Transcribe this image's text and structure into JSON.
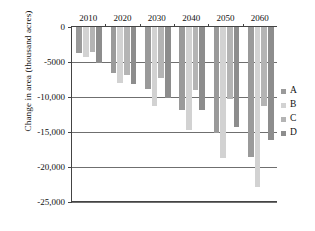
{
  "chart_data": {
    "type": "bar",
    "title": "",
    "xlabel": "",
    "ylabel": "Change in area (thousand acres)",
    "categories": [
      "2010",
      "2020",
      "2030",
      "2040",
      "2050",
      "2060"
    ],
    "ylim": [
      -25000,
      0
    ],
    "yticks": [
      0,
      -5000,
      -10000,
      -15000,
      -20000,
      -25000
    ],
    "ytick_labels": [
      "0",
      "-5000",
      "-10,000",
      "-15,000",
      "-20,000",
      "-25,000"
    ],
    "grid": true,
    "legend_position": "right",
    "series": [
      {
        "name": "A",
        "color": "#9a9a9a",
        "values": [
          -3700,
          -6500,
          -8900,
          -11800,
          -15100,
          -18500
        ]
      },
      {
        "name": "B",
        "color": "#d2d2d2",
        "values": [
          -4300,
          -8000,
          -11300,
          -14700,
          -18700,
          -22800
        ]
      },
      {
        "name": "C",
        "color": "#b4b4b4",
        "values": [
          -3600,
          -6900,
          -7300,
          -9000,
          -10300,
          -11300
        ]
      },
      {
        "name": "D",
        "color": "#8d8d8d",
        "values": [
          -5200,
          -8200,
          -10200,
          -11900,
          -14300,
          -16100
        ]
      }
    ]
  },
  "legend": {
    "entries": [
      {
        "label": "A"
      },
      {
        "label": "B"
      },
      {
        "label": "C"
      },
      {
        "label": "D"
      }
    ]
  }
}
